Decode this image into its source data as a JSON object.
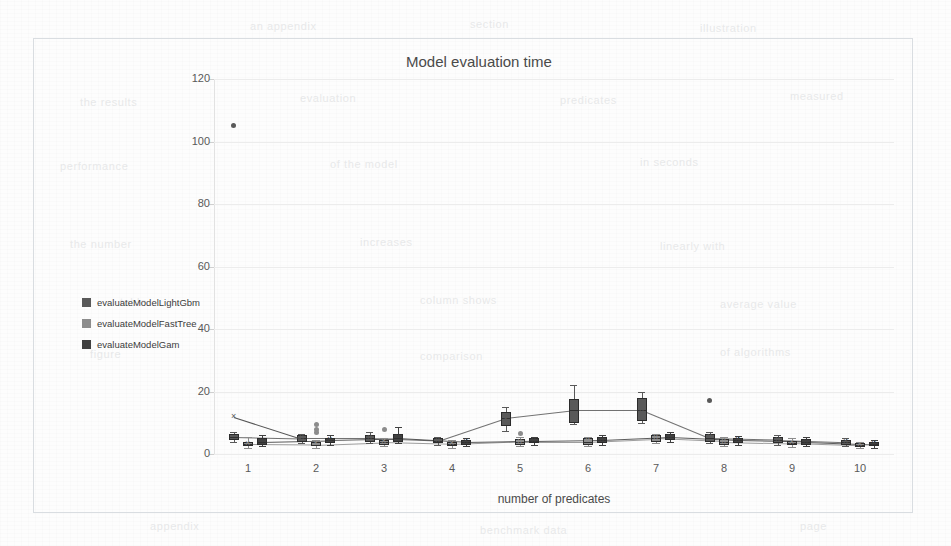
{
  "chart_title": "Model evaluation time",
  "legend": {
    "position": "left-outside",
    "items": [
      {
        "label": "evaluateModelLightGbm",
        "color": "#595959"
      },
      {
        "label": "evaluateModelFastTree",
        "color": "#8c8c8c"
      },
      {
        "label": "evaluateModelGam",
        "color": "#404040"
      }
    ]
  },
  "axes": {
    "x_title": "number of predicates",
    "y_title": "",
    "y_ticks": [
      "0",
      "20",
      "40",
      "60",
      "80",
      "100",
      "120"
    ],
    "x_ticks": [
      "1",
      "2",
      "3",
      "4",
      "5",
      "6",
      "7",
      "8",
      "9",
      "10"
    ]
  },
  "chart_data": {
    "type": "box",
    "title": "Model evaluation time",
    "xlabel": "number of predicates",
    "ylabel": "",
    "xlim": [
      0.5,
      10.5
    ],
    "ylim": [
      0,
      120
    ],
    "ytick_step": 20,
    "grid": true,
    "categories": [
      "1",
      "2",
      "3",
      "4",
      "5",
      "6",
      "7",
      "8",
      "9",
      "10"
    ],
    "series": [
      {
        "name": "evaluateModelLightGbm",
        "color": "#595959",
        "boxes": [
          {
            "category": "1",
            "q1": 4.5,
            "median": 5.5,
            "q3": 6.5,
            "low": 4.0,
            "high": 7.0,
            "mean": 12.0,
            "outliers": [
              105.0
            ]
          },
          {
            "category": "2",
            "q1": 4.0,
            "median": 5.0,
            "q3": 6.0,
            "low": 3.5,
            "high": 6.5,
            "mean": 5.0,
            "outliers": []
          },
          {
            "category": "3",
            "q1": 4.0,
            "median": 5.0,
            "q3": 6.0,
            "low": 3.5,
            "high": 7.0,
            "mean": 5.2,
            "outliers": []
          },
          {
            "category": "4",
            "q1": 3.5,
            "median": 4.2,
            "q3": 5.0,
            "low": 3.0,
            "high": 5.5,
            "mean": 4.3,
            "outliers": []
          },
          {
            "category": "5",
            "q1": 9.0,
            "median": 11.5,
            "q3": 13.5,
            "low": 7.5,
            "high": 15.0,
            "mean": 11.0,
            "outliers": []
          },
          {
            "category": "6",
            "q1": 10.0,
            "median": 14.0,
            "q3": 17.5,
            "low": 9.5,
            "high": 22.0,
            "mean": 14.5,
            "outliers": []
          },
          {
            "category": "7",
            "q1": 10.5,
            "median": 14.0,
            "q3": 18.0,
            "low": 10.0,
            "high": 20.0,
            "mean": 14.0,
            "outliers": []
          },
          {
            "category": "8",
            "q1": 4.0,
            "median": 5.0,
            "q3": 6.5,
            "low": 3.5,
            "high": 7.0,
            "mean": 5.5,
            "outliers": [
              17.0
            ]
          },
          {
            "category": "9",
            "q1": 3.5,
            "median": 4.5,
            "q3": 5.5,
            "low": 3.0,
            "high": 6.0,
            "mean": 4.5,
            "outliers": []
          },
          {
            "category": "10",
            "q1": 3.0,
            "median": 3.8,
            "q3": 4.5,
            "low": 2.5,
            "high": 5.0,
            "mean": 3.8,
            "outliers": []
          }
        ]
      },
      {
        "name": "evaluateModelFastTree",
        "color": "#8c8c8c",
        "boxes": [
          {
            "category": "1",
            "q1": 2.5,
            "median": 3.2,
            "q3": 4.0,
            "low": 2.0,
            "high": 5.5,
            "mean": 3.3,
            "outliers": []
          },
          {
            "category": "2",
            "q1": 2.5,
            "median": 3.0,
            "q3": 3.8,
            "low": 2.0,
            "high": 4.5,
            "mean": 3.1,
            "outliers": [
              9.5,
              8.0,
              6.8
            ]
          },
          {
            "category": "3",
            "q1": 3.0,
            "median": 3.8,
            "q3": 4.5,
            "low": 2.5,
            "high": 5.0,
            "mean": 3.9,
            "outliers": [
              8.0
            ]
          },
          {
            "category": "4",
            "q1": 2.5,
            "median": 3.2,
            "q3": 4.0,
            "low": 2.0,
            "high": 4.5,
            "mean": 3.2,
            "outliers": []
          },
          {
            "category": "5",
            "q1": 3.0,
            "median": 4.0,
            "q3": 4.8,
            "low": 2.5,
            "high": 5.5,
            "mean": 4.0,
            "outliers": [
              6.5
            ]
          },
          {
            "category": "6",
            "q1": 3.0,
            "median": 4.0,
            "q3": 5.0,
            "low": 2.5,
            "high": 5.5,
            "mean": 4.2,
            "outliers": []
          },
          {
            "category": "7",
            "q1": 4.0,
            "median": 5.0,
            "q3": 6.0,
            "low": 3.5,
            "high": 6.5,
            "mean": 5.0,
            "outliers": []
          },
          {
            "category": "8",
            "q1": 3.0,
            "median": 4.0,
            "q3": 4.8,
            "low": 2.5,
            "high": 5.5,
            "mean": 4.0,
            "outliers": []
          },
          {
            "category": "9",
            "q1": 2.8,
            "median": 3.5,
            "q3": 4.2,
            "low": 2.2,
            "high": 5.0,
            "mean": 3.6,
            "outliers": []
          },
          {
            "category": "10",
            "q1": 2.2,
            "median": 2.8,
            "q3": 3.5,
            "low": 1.8,
            "high": 4.0,
            "mean": 2.9,
            "outliers": []
          }
        ]
      },
      {
        "name": "evaluateModelGam",
        "color": "#404040",
        "boxes": [
          {
            "category": "1",
            "q1": 3.0,
            "median": 4.0,
            "q3": 5.0,
            "low": 2.5,
            "high": 6.0,
            "mean": 4.1,
            "outliers": []
          },
          {
            "category": "2",
            "q1": 3.5,
            "median": 4.5,
            "q3": 5.2,
            "low": 3.0,
            "high": 6.0,
            "mean": 4.5,
            "outliers": []
          },
          {
            "category": "3",
            "q1": 4.0,
            "median": 5.0,
            "q3": 6.5,
            "low": 3.5,
            "high": 8.5,
            "mean": 5.4,
            "outliers": []
          },
          {
            "category": "4",
            "q1": 3.0,
            "median": 3.8,
            "q3": 4.5,
            "low": 2.5,
            "high": 5.0,
            "mean": 3.8,
            "outliers": []
          },
          {
            "category": "5",
            "q1": 3.5,
            "median": 4.2,
            "q3": 5.0,
            "low": 3.0,
            "high": 5.5,
            "mean": 4.3,
            "outliers": []
          },
          {
            "category": "6",
            "q1": 3.5,
            "median": 4.5,
            "q3": 5.5,
            "low": 3.0,
            "high": 6.0,
            "mean": 4.6,
            "outliers": []
          },
          {
            "category": "7",
            "q1": 4.5,
            "median": 5.5,
            "q3": 6.5,
            "low": 4.0,
            "high": 7.0,
            "mean": 5.6,
            "outliers": []
          },
          {
            "category": "8",
            "q1": 3.5,
            "median": 4.5,
            "q3": 5.2,
            "low": 3.0,
            "high": 5.8,
            "mean": 4.5,
            "outliers": []
          },
          {
            "category": "9",
            "q1": 3.0,
            "median": 4.0,
            "q3": 4.8,
            "low": 2.5,
            "high": 5.5,
            "mean": 4.0,
            "outliers": []
          },
          {
            "category": "10",
            "q1": 2.5,
            "median": 3.2,
            "q3": 4.0,
            "low": 2.0,
            "high": 4.5,
            "mean": 3.2,
            "outliers": []
          }
        ]
      }
    ]
  },
  "ghost_text": [
    {
      "t": "an appendix",
      "x": 250,
      "y": 20
    },
    {
      "t": "section",
      "x": 470,
      "y": 18
    },
    {
      "t": "illustration",
      "x": 700,
      "y": 22
    },
    {
      "t": "the results",
      "x": 80,
      "y": 96
    },
    {
      "t": "evaluation",
      "x": 300,
      "y": 92
    },
    {
      "t": "predicates",
      "x": 560,
      "y": 94
    },
    {
      "t": "measured",
      "x": 790,
      "y": 90
    },
    {
      "t": "performance",
      "x": 60,
      "y": 160
    },
    {
      "t": "of the model",
      "x": 330,
      "y": 158
    },
    {
      "t": "in seconds",
      "x": 640,
      "y": 156
    },
    {
      "t": "the number",
      "x": 70,
      "y": 238
    },
    {
      "t": "increases",
      "x": 360,
      "y": 236
    },
    {
      "t": "linearly with",
      "x": 660,
      "y": 240
    },
    {
      "t": "table",
      "x": 120,
      "y": 296
    },
    {
      "t": "column shows",
      "x": 420,
      "y": 294
    },
    {
      "t": "average value",
      "x": 720,
      "y": 298
    },
    {
      "t": "figure",
      "x": 90,
      "y": 348
    },
    {
      "t": "comparison",
      "x": 420,
      "y": 350
    },
    {
      "t": "of algorithms",
      "x": 720,
      "y": 346
    },
    {
      "t": "appendix",
      "x": 150,
      "y": 520
    },
    {
      "t": "benchmark data",
      "x": 480,
      "y": 524
    },
    {
      "t": "page",
      "x": 800,
      "y": 520
    }
  ]
}
